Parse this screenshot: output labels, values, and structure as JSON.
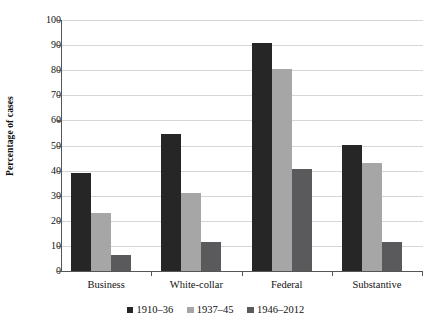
{
  "chart_data": {
    "type": "bar",
    "title": "",
    "xlabel": "",
    "ylabel": "Percentage of cases",
    "categories": [
      "Business",
      "White-collar",
      "Federal",
      "Substantive"
    ],
    "series": [
      {
        "name": "1910–36",
        "color": "#262626",
        "values": [
          39.2,
          54.4,
          91.0,
          50.4
        ]
      },
      {
        "name": "1937–45",
        "color": "#a6a6a6",
        "values": [
          23.2,
          30.9,
          80.6,
          43.1
        ]
      },
      {
        "name": "1946–2012",
        "color": "#5a5a5c",
        "values": [
          6.5,
          11.5,
          40.6,
          11.5
        ]
      }
    ],
    "ylim": [
      0,
      100
    ],
    "yticks": [
      0,
      10,
      20,
      30,
      40,
      50,
      60,
      70,
      80,
      90,
      100
    ],
    "ytick_labels": [
      "0",
      "10",
      "20",
      "30",
      "40",
      "50",
      "60",
      "70",
      "80",
      "90",
      "100"
    ],
    "grid": true,
    "legend_position": "bottom"
  }
}
